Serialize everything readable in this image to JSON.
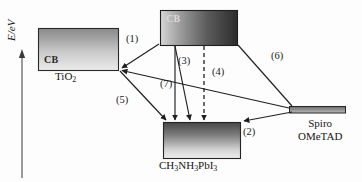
{
  "figure": {
    "type": "energy-band-diagram",
    "title": "",
    "axis": {
      "y_label": "E/eV",
      "y_label_italic_part": "E",
      "y_label_rest": "/eV",
      "direction": "up",
      "arrow": "upward-arrow"
    },
    "layers": [
      {
        "id": "tio2",
        "name": "TiO2",
        "caption_html": "TiO<sub>2</sub>",
        "band_label": "CB",
        "role": "electron-transport-layer",
        "box": {
          "x": 38,
          "y": 28,
          "w": 80,
          "h": 42
        },
        "gradient": {
          "direction": "to-bottom",
          "from": "#8e8e8e",
          "to": "#e9e9e9"
        },
        "border": "#2a2a2a"
      },
      {
        "id": "perovskite-cb",
        "name": "Perovskite conduction band",
        "caption_html": "",
        "band_label": "CB",
        "role": "absorber-conduction-band",
        "box": {
          "x": 160,
          "y": 10,
          "w": 77,
          "h": 35
        },
        "gradient": {
          "direction": "to-right",
          "from": "#d2d2d2",
          "to": "#2e2e2e"
        },
        "border": "#1f1f1f"
      },
      {
        "id": "perovskite-vb",
        "name": "Perovskite valence band",
        "caption_html": "CH<sub>3</sub>NH<sub>3</sub>PbI<sub>3</sub>",
        "band_label": "",
        "role": "absorber-valence-band",
        "box": {
          "x": 163,
          "y": 122,
          "w": 77,
          "h": 36
        },
        "gradient": {
          "direction": "to-bottom",
          "from": "#4a4a4a",
          "to": "#ededed"
        },
        "border": "#242424"
      },
      {
        "id": "spiro",
        "name": "Spiro-OMeTAD HOMO level",
        "caption_line1": "Spiro",
        "caption_line2": "OMeTAD",
        "band_label": "",
        "role": "hole-transport-layer",
        "box": {
          "x": 289,
          "y": 106,
          "w": 57,
          "h": 7
        },
        "gradient": {
          "direction": "to-bottom",
          "from": "#6e6e6e",
          "to": "#b4b4b4"
        },
        "border": "#262626"
      }
    ],
    "processes": [
      {
        "id": "1",
        "label": "(1)",
        "style": "solid-arrow",
        "description": "electron injection from perovskite CB into TiO2 CB"
      },
      {
        "id": "2",
        "label": "(2)",
        "style": "solid-arrow",
        "description": "hole transfer from perovskite VB to Spiro-OMeTAD"
      },
      {
        "id": "3",
        "label": "(3)",
        "style": "solid-arrow",
        "description": "radiative recombination in perovskite"
      },
      {
        "id": "4",
        "label": "(4)",
        "style": "dashed-double-arrow",
        "description": "non-radiative recombination in perovskite"
      },
      {
        "id": "5",
        "label": "(5)",
        "style": "solid-arrow",
        "description": "back recombination from TiO2 to perovskite VB"
      },
      {
        "id": "6",
        "label": "(6)",
        "style": "solid-arrow",
        "description": "recombination from perovskite CB to Spiro-OMeTAD"
      },
      {
        "id": "7",
        "label": "(7)",
        "style": "solid-arrow",
        "description": "recombination between TiO2 CB and Spiro-OMeTAD"
      }
    ],
    "colors": {
      "background": "#fdfdfd",
      "stroke": "#1f1f1f",
      "text": "#151515"
    }
  }
}
